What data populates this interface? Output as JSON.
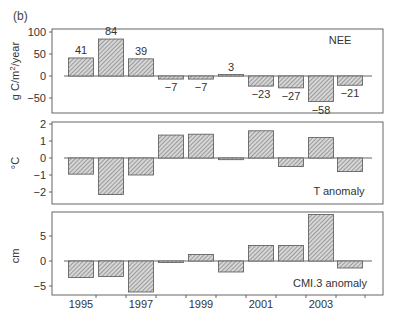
{
  "figure_label": "(b)",
  "chart_data": [
    {
      "type": "bar",
      "title": "NEE",
      "xlabel": "",
      "ylabel": "g C/m²/year",
      "ylim": [
        -70,
        100
      ],
      "yticks": [
        100,
        50,
        0,
        -50
      ],
      "categories": [
        "1995",
        "1996",
        "1997",
        "1998",
        "1999",
        "2000",
        "2001",
        "2002",
        "2003",
        "2004"
      ],
      "values": [
        41,
        84,
        39,
        -7,
        -7,
        3,
        -23,
        -27,
        -58,
        -21
      ],
      "data_labels": [
        "41",
        "84",
        "39",
        "−7",
        "−7",
        "3",
        "−23",
        "−27",
        "−58",
        "−21"
      ],
      "grid": false,
      "legend_position": "top-right",
      "annotation": "NEE"
    },
    {
      "type": "bar",
      "title": "T anomaly",
      "xlabel": "",
      "ylabel": "°C",
      "ylim": [
        -2.8,
        2.1
      ],
      "yticks": [
        2,
        1,
        0,
        -1,
        -2
      ],
      "categories": [
        "1995",
        "1996",
        "1997",
        "1998",
        "1999",
        "2000",
        "2001",
        "2002",
        "2003",
        "2004"
      ],
      "values": [
        -0.95,
        -2.15,
        -1.0,
        1.35,
        1.4,
        -0.1,
        1.6,
        -0.5,
        1.2,
        -0.8
      ],
      "grid": false,
      "annotation": "T anomaly"
    },
    {
      "type": "bar",
      "title": "CMI.3 anomaly",
      "xlabel": "Year",
      "ylabel": "cm",
      "ylim": [
        -6.5,
        10
      ],
      "yticks": [
        5,
        0,
        -5
      ],
      "categories": [
        "1995",
        "1996",
        "1997",
        "1998",
        "1999",
        "2000",
        "2001",
        "2002",
        "2003",
        "2004"
      ],
      "values": [
        -3.3,
        -3.1,
        -6.2,
        -0.1,
        1.3,
        -2.2,
        3.1,
        3.1,
        9.3,
        -1.4
      ],
      "xtick_labels": [
        "1995",
        "1997",
        "1999",
        "2001",
        "2003"
      ],
      "grid": false,
      "annotation": "CMI.3 anomaly"
    }
  ]
}
